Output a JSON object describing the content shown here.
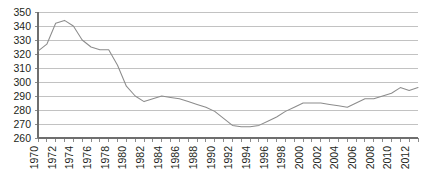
{
  "chart_data": {
    "type": "line",
    "title": "",
    "subtitle": "",
    "xlabel": "",
    "ylabel": "",
    "xlim": [
      1970,
      2013
    ],
    "ylim": [
      260,
      350
    ],
    "grid": true,
    "legend": false,
    "legend_position": "none",
    "y_ticks": [
      260,
      270,
      280,
      290,
      300,
      310,
      320,
      330,
      340,
      350
    ],
    "x_tick_labels": [
      "1970",
      "1972",
      "1974",
      "1976",
      "1978",
      "1980",
      "1982",
      "1984",
      "1986",
      "1988",
      "1990",
      "1992",
      "1994",
      "1996",
      "1998",
      "2000",
      "2002",
      "2004",
      "2006",
      "2008",
      "2010",
      "2012"
    ],
    "x": [
      1970,
      1971,
      1972,
      1973,
      1974,
      1975,
      1976,
      1977,
      1978,
      1979,
      1980,
      1981,
      1982,
      1983,
      1984,
      1985,
      1986,
      1987,
      1988,
      1989,
      1990,
      1991,
      1992,
      1993,
      1994,
      1995,
      1996,
      1997,
      1998,
      1999,
      2000,
      2001,
      2002,
      2003,
      2004,
      2005,
      2006,
      2007,
      2008,
      2009,
      2010,
      2011,
      2012,
      2013
    ],
    "values": [
      322,
      327,
      342,
      344,
      340,
      330,
      325,
      323,
      323,
      312,
      297,
      290,
      286,
      288,
      290,
      289,
      288,
      286,
      284,
      282,
      279,
      274,
      269,
      268,
      268,
      269,
      272,
      275,
      279,
      282,
      285,
      285,
      285,
      284,
      283,
      282,
      285,
      288,
      288,
      290,
      292,
      296,
      294,
      296
    ],
    "series": [
      {
        "name": "series-1",
        "color": "#8c8c8c",
        "values": [
          322,
          327,
          342,
          344,
          340,
          330,
          325,
          323,
          323,
          312,
          297,
          290,
          286,
          288,
          290,
          289,
          288,
          286,
          284,
          282,
          279,
          274,
          269,
          268,
          268,
          269,
          272,
          275,
          279,
          282,
          285,
          285,
          285,
          284,
          283,
          282,
          285,
          288,
          288,
          290,
          292,
          296,
          294,
          296
        ]
      }
    ]
  },
  "colors": {
    "line": "#8c8c8c",
    "grid": "#9a9a9a",
    "axis": "#6e6e6e",
    "text": "#231f20",
    "background": "#ffffff"
  }
}
